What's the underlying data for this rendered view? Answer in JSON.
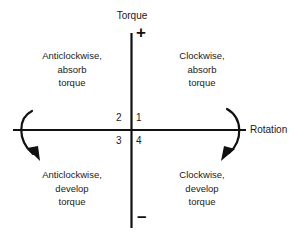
{
  "diagram": {
    "axes": {
      "vertical_label": "Torque",
      "horizontal_label": "Rotation",
      "positive_sign": "+",
      "negative_sign": "–"
    },
    "quadrant_numbers": {
      "upper_right": "1",
      "upper_left": "2",
      "lower_left": "3",
      "lower_right": "4"
    },
    "quadrants": {
      "top_left": {
        "line1": "Anticlockwise,",
        "line2": "absorb",
        "line3": "torque"
      },
      "top_right": {
        "line1": "Clockwise,",
        "line2": "absorb",
        "line3": "torque"
      },
      "bottom_left": {
        "line1": "Anticlockwise,",
        "line2": "develop",
        "line3": "torque"
      },
      "bottom_right": {
        "line1": "Clockwise,",
        "line2": "develop",
        "line3": "torque"
      }
    },
    "arrows": {
      "left_label": "anticlockwise-rotation-arrow",
      "right_label": "clockwise-rotation-arrow"
    },
    "colors": {
      "background": "#ffffff",
      "ink": "#1a1a1a",
      "axis": "#111111"
    }
  }
}
